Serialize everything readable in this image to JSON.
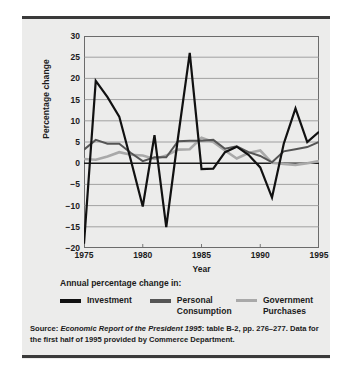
{
  "figure": {
    "background_color": "#ececeb",
    "rule_color": "#3a3a3a"
  },
  "chart_data": {
    "type": "line",
    "title": "",
    "xlabel": "Year",
    "ylabel": "Percentage change",
    "xlim": [
      1975,
      1995
    ],
    "ylim": [
      -20,
      30
    ],
    "ytick_values": [
      30,
      25,
      20,
      15,
      10,
      5,
      0,
      -5,
      -10,
      -15,
      -20
    ],
    "ytick_labels": [
      "30",
      "25",
      "20",
      "15",
      "10",
      "5",
      "0",
      "−5",
      "−10",
      "−15",
      "−20"
    ],
    "xtick_values": [
      1975,
      1980,
      1985,
      1990,
      1995
    ],
    "xtick_labels": [
      "1975",
      "1980",
      "1985",
      "1990",
      "1995"
    ],
    "grid": "horizontal",
    "zero_line": true,
    "legend_position": "below",
    "x": [
      1975,
      1976,
      1977,
      1978,
      1979,
      1980,
      1981,
      1982,
      1983,
      1984,
      1985,
      1986,
      1987,
      1988,
      1989,
      1990,
      1991,
      1992,
      1993,
      1994,
      1995
    ],
    "series": [
      {
        "name": "Investment",
        "color": "#111111",
        "width": 2.2,
        "values": [
          -19.0,
          19.4,
          15.6,
          11.0,
          0.6,
          -10.2,
          6.6,
          -15.1,
          6.0,
          26.0,
          -1.4,
          -1.3,
          2.6,
          3.9,
          2.0,
          -1.0,
          -8.1,
          4.6,
          12.9,
          5.0,
          7.4
        ]
      },
      {
        "name": "Personal Consumption",
        "color": "#555555",
        "width": 2.0,
        "values": [
          3.2,
          5.5,
          4.6,
          4.6,
          2.4,
          0.5,
          1.4,
          1.4,
          5.2,
          5.3,
          5.3,
          5.5,
          3.4,
          4.0,
          2.6,
          1.7,
          0.2,
          2.8,
          3.3,
          3.8,
          5.0
        ]
      },
      {
        "name": "Government Purchases",
        "color": "#a9a9a9",
        "width": 2.6,
        "values": [
          1.0,
          0.8,
          1.6,
          2.6,
          2.0,
          1.8,
          1.0,
          1.8,
          3.2,
          3.3,
          6.0,
          5.0,
          3.0,
          1.1,
          2.4,
          3.0,
          0.1,
          -0.2,
          -0.4,
          0.0,
          0.5
        ]
      }
    ]
  },
  "legend": {
    "title": "Annual percentage change in:",
    "items": [
      {
        "label": "Investment",
        "color": "#111111"
      },
      {
        "label": "Personal\nConsumption",
        "color": "#555555"
      },
      {
        "label": "Government\nPurchases",
        "color": "#a9a9a9"
      }
    ]
  },
  "source": {
    "label": "Source",
    "colon": ": ",
    "title_italic": "Economic Report of the President 1995",
    "rest": ": table B-2, pp. 276–277. Data for the first half of 1995 provided by Commerce Department."
  }
}
